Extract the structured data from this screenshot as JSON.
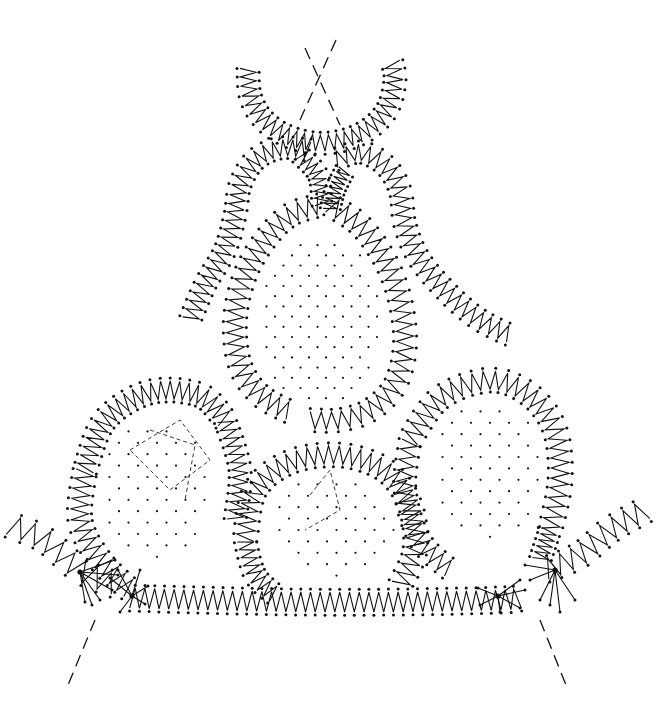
{
  "diagram": {
    "type": "bobbin-lace-pricking",
    "background": "#ffffff",
    "ink": "#111111",
    "zigzag_bands": [
      {
        "name": "top-arc",
        "points": [
          [
            248,
            68
          ],
          [
            250,
            95
          ],
          [
            262,
            118
          ],
          [
            285,
            135
          ],
          [
            315,
            143
          ],
          [
            345,
            140
          ],
          [
            370,
            128
          ],
          [
            388,
            108
          ],
          [
            395,
            80
          ],
          [
            392,
            62
          ]
        ],
        "width": 16,
        "teeth": 28
      },
      {
        "name": "left-lobe-outer",
        "points": [
          [
            310,
            150
          ],
          [
            280,
            148
          ],
          [
            255,
            160
          ],
          [
            240,
            185
          ],
          [
            235,
            215
          ],
          [
            225,
            250
          ],
          [
            205,
            285
          ],
          [
            190,
            320
          ]
        ],
        "width": 16,
        "teeth": 26
      },
      {
        "name": "left-lobe-inner",
        "points": [
          [
            300,
            155
          ],
          [
            318,
            175
          ],
          [
            322,
            205
          ]
        ],
        "width": 14,
        "teeth": 8
      },
      {
        "name": "right-lobe-outer",
        "points": [
          [
            335,
            160
          ],
          [
            360,
            152
          ],
          [
            385,
            165
          ],
          [
            400,
            190
          ],
          [
            405,
            225
          ],
          [
            420,
            260
          ],
          [
            450,
            295
          ],
          [
            480,
            320
          ],
          [
            510,
            335
          ]
        ],
        "width": 16,
        "teeth": 28
      },
      {
        "name": "right-lobe-inner",
        "points": [
          [
            345,
            170
          ],
          [
            335,
            190
          ],
          [
            330,
            210
          ]
        ],
        "width": 14,
        "teeth": 8
      },
      {
        "name": "central-leaf-left",
        "points": [
          [
            320,
            205
          ],
          [
            290,
            215
          ],
          [
            265,
            240
          ],
          [
            245,
            275
          ],
          [
            235,
            320
          ],
          [
            240,
            365
          ],
          [
            260,
            395
          ],
          [
            290,
            412
          ]
        ],
        "width": 17,
        "teeth": 26
      },
      {
        "name": "central-leaf-right",
        "points": [
          [
            330,
            205
          ],
          [
            360,
            225
          ],
          [
            385,
            260
          ],
          [
            400,
            300
          ],
          [
            405,
            345
          ],
          [
            395,
            385
          ],
          [
            370,
            410
          ],
          [
            340,
            420
          ],
          [
            310,
            420
          ]
        ],
        "width": 17,
        "teeth": 28
      },
      {
        "name": "left-flower",
        "points": [
          [
            85,
            470
          ],
          [
            105,
            420
          ],
          [
            150,
            392
          ],
          [
            200,
            395
          ],
          [
            225,
            420
          ]
        ],
        "width": 18,
        "teeth": 22
      },
      {
        "name": "left-flower-lower",
        "points": [
          [
            85,
            470
          ],
          [
            80,
            520
          ],
          [
            100,
            560
          ],
          [
            130,
            590
          ]
        ],
        "width": 18,
        "teeth": 14
      },
      {
        "name": "left-flower-right",
        "points": [
          [
            225,
            420
          ],
          [
            240,
            470
          ],
          [
            235,
            520
          ]
        ],
        "width": 16,
        "teeth": 12
      },
      {
        "name": "middle-flower",
        "points": [
          [
            245,
            540
          ],
          [
            255,
            490
          ],
          [
            290,
            462
          ],
          [
            340,
            455
          ],
          [
            385,
            470
          ],
          [
            410,
            505
          ],
          [
            415,
            550
          ],
          [
            400,
            585
          ]
        ],
        "width": 18,
        "teeth": 32
      },
      {
        "name": "middle-flower-left",
        "points": [
          [
            245,
            540
          ],
          [
            255,
            575
          ],
          [
            275,
            595
          ]
        ],
        "width": 16,
        "teeth": 8
      },
      {
        "name": "right-flower",
        "points": [
          [
            410,
            440
          ],
          [
            440,
            398
          ],
          [
            490,
            380
          ],
          [
            530,
            395
          ],
          [
            555,
            430
          ],
          [
            560,
            480
          ],
          [
            550,
            530
          ]
        ],
        "width": 18,
        "teeth": 28
      },
      {
        "name": "right-flower-left",
        "points": [
          [
            410,
            440
          ],
          [
            405,
            490
          ],
          [
            420,
            540
          ],
          [
            450,
            570
          ]
        ],
        "width": 16,
        "teeth": 14
      },
      {
        "name": "right-flower-lower",
        "points": [
          [
            550,
            530
          ],
          [
            540,
            560
          ]
        ],
        "width": 16,
        "teeth": 5
      },
      {
        "name": "base-border",
        "points": [
          [
            130,
            598
          ],
          [
            200,
            600
          ],
          [
            300,
            602
          ],
          [
            400,
            602
          ],
          [
            500,
            600
          ],
          [
            520,
            598
          ]
        ],
        "width": 20,
        "teeth": 40
      },
      {
        "name": "left-tail",
        "points": [
          [
            10,
            525
          ],
          [
            45,
            540
          ],
          [
            80,
            570
          ],
          [
            115,
            585
          ]
        ],
        "width": 20,
        "teeth": 8
      },
      {
        "name": "right-tail",
        "points": [
          [
            545,
            570
          ],
          [
            580,
            555
          ],
          [
            610,
            530
          ],
          [
            645,
            510
          ]
        ],
        "width": 20,
        "teeth": 9
      }
    ],
    "dot_fields": [
      {
        "name": "central-ground",
        "cx": 320,
        "cy": 320,
        "rx": 62,
        "ry": 85,
        "spacing": 17
      },
      {
        "name": "left-flower-ground",
        "cx": 155,
        "cy": 490,
        "rx": 55,
        "ry": 70,
        "spacing": 19
      },
      {
        "name": "middle-flower-ground",
        "cx": 332,
        "cy": 525,
        "rx": 62,
        "ry": 52,
        "spacing": 19
      },
      {
        "name": "right-flower-ground",
        "cx": 488,
        "cy": 470,
        "rx": 55,
        "ry": 70,
        "spacing": 19
      }
    ],
    "fine_dashed_paths": [
      {
        "name": "left-flower-center-1",
        "d": "M130 450 L180 420 L210 460 L170 490 Z"
      },
      {
        "name": "left-flower-center-2",
        "d": "M150 430 L195 445 L185 500"
      },
      {
        "name": "middle-flower-center",
        "d": "M310 495 L330 470 L340 510 L305 530"
      }
    ],
    "dashed_lines": [
      {
        "name": "top-cross-1",
        "x1": 336,
        "y1": 40,
        "x2": 300,
        "y2": 120
      },
      {
        "name": "top-cross-2",
        "x1": 305,
        "y1": 48,
        "x2": 340,
        "y2": 125
      },
      {
        "name": "bottom-left-guide",
        "x1": 95,
        "y1": 620,
        "x2": 68,
        "y2": 685
      },
      {
        "name": "bottom-right-guide",
        "x1": 540,
        "y1": 620,
        "x2": 568,
        "y2": 690
      }
    ],
    "fans": [
      {
        "name": "left-fan-outer",
        "cx": 80,
        "cy": 572,
        "rays": [
          [
            115,
            560
          ],
          [
            118,
            575
          ],
          [
            112,
            590
          ],
          [
            100,
            600
          ],
          [
            92,
            605
          ],
          [
            85,
            602
          ]
        ]
      },
      {
        "name": "left-fan-inner",
        "cx": 132,
        "cy": 596,
        "rays": [
          [
            110,
            578
          ],
          [
            118,
            570
          ],
          [
            140,
            570
          ],
          [
            148,
            586
          ],
          [
            145,
            604
          ],
          [
            120,
            612
          ]
        ]
      },
      {
        "name": "right-fan-outer",
        "cx": 555,
        "cy": 570,
        "rays": [
          [
            525,
            565
          ],
          [
            530,
            580
          ],
          [
            540,
            600
          ],
          [
            550,
            605
          ],
          [
            560,
            612
          ],
          [
            575,
            600
          ]
        ]
      },
      {
        "name": "right-fan-inner",
        "cx": 498,
        "cy": 596,
        "rays": [
          [
            520,
            580
          ],
          [
            525,
            590
          ],
          [
            520,
            608
          ],
          [
            500,
            612
          ],
          [
            480,
            605
          ],
          [
            478,
            588
          ]
        ]
      }
    ],
    "labels": []
  }
}
